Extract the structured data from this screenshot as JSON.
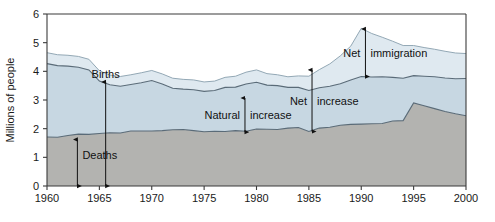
{
  "chart_data": {
    "type": "area",
    "title": "",
    "xlabel": "",
    "ylabel": "Millions of people",
    "xlim": [
      1960,
      2000
    ],
    "ylim": [
      0,
      6
    ],
    "grid": false,
    "legend": "none",
    "x_ticks": [
      "1960",
      "1965",
      "1970",
      "1975",
      "1980",
      "1985",
      "1990",
      "1995",
      "2000"
    ],
    "y_ticks": [
      "0",
      "1",
      "2",
      "3",
      "4",
      "5",
      "6"
    ],
    "x": [
      1960,
      1961,
      1962,
      1963,
      1964,
      1965,
      1966,
      1967,
      1968,
      1969,
      1970,
      1971,
      1972,
      1973,
      1974,
      1975,
      1976,
      1977,
      1978,
      1979,
      1980,
      1981,
      1982,
      1983,
      1984,
      1985,
      1986,
      1987,
      1988,
      1989,
      1990,
      1991,
      1992,
      1993,
      1994,
      1995,
      1996,
      1997,
      1998,
      1999,
      2000
    ],
    "series": [
      {
        "name": "Deaths",
        "stack": "bottom",
        "values": [
          1.71,
          1.7,
          1.76,
          1.81,
          1.8,
          1.83,
          1.86,
          1.85,
          1.92,
          1.92,
          1.92,
          1.93,
          1.96,
          1.97,
          1.93,
          1.89,
          1.91,
          1.9,
          1.93,
          1.91,
          1.99,
          1.98,
          1.97,
          2.02,
          2.04,
          1.9,
          2.02,
          2.05,
          2.12,
          2.15,
          2.16,
          2.17,
          2.18,
          2.27,
          2.28,
          2.9,
          2.8,
          2.7,
          2.6,
          2.52,
          2.45
        ]
      },
      {
        "name": "Natural increase",
        "stack": "middle",
        "values": [
          2.56,
          2.5,
          2.42,
          2.33,
          2.25,
          1.83,
          1.67,
          1.63,
          1.62,
          1.68,
          1.76,
          1.63,
          1.45,
          1.41,
          1.43,
          1.41,
          1.42,
          1.54,
          1.52,
          1.65,
          1.63,
          1.54,
          1.53,
          1.42,
          1.4,
          1.43,
          1.41,
          1.43,
          1.45,
          1.55,
          1.66,
          1.63,
          1.63,
          1.52,
          1.48,
          0.95,
          1.03,
          1.11,
          1.17,
          1.22,
          1.3
        ]
      },
      {
        "name": "Net immigration",
        "stack": "top",
        "values": [
          0.38,
          0.38,
          0.38,
          0.38,
          0.37,
          0.36,
          0.34,
          0.34,
          0.34,
          0.35,
          0.35,
          0.35,
          0.35,
          0.34,
          0.34,
          0.33,
          0.33,
          0.35,
          0.38,
          0.41,
          0.43,
          0.4,
          0.38,
          0.37,
          0.4,
          0.5,
          0.63,
          0.78,
          0.97,
          1.18,
          1.68,
          1.52,
          1.38,
          1.26,
          1.14,
          1.05,
          1.0,
          0.96,
          0.93,
          0.9,
          0.87
        ]
      }
    ],
    "totals_note": {
      "births_1960": 4.27,
      "total_1960": 4.65,
      "total_peak_1990": 5.5,
      "total_2000": 4.62
    },
    "colors": {
      "deaths_fill": "#b3b3b0",
      "natural_increase_fill": "#c7d7e2",
      "net_immigration_fill": "#dfe9f0",
      "line": "#5a6b78",
      "text": "#111111",
      "axis": "#3b3b3b",
      "background": "#ffffff"
    },
    "annotations": [
      {
        "id": "deaths",
        "label": "Deaths",
        "kind": "double-arrow",
        "from_value": 0,
        "to_value": 1.62,
        "at_year": 1962.9
      },
      {
        "id": "births",
        "label": "Births",
        "kind": "double-arrow",
        "from_value": 0,
        "to_value": 3.63,
        "at_year": 1965.6
      },
      {
        "id": "natural-increase",
        "label": "Natural increase",
        "kind": "double-arrow",
        "from_value": 1.88,
        "to_value": 3.07,
        "at_year": 1978.9
      },
      {
        "id": "net-increase",
        "label": "Net increase",
        "kind": "double-arrow",
        "from_value": 1.9,
        "to_value": 4.05,
        "at_year": 1985.3
      },
      {
        "id": "net-immigration",
        "label": "Net immigration",
        "kind": "double-arrow",
        "from_value": 3.82,
        "to_value": 5.48,
        "at_year": 1990.4
      }
    ]
  }
}
